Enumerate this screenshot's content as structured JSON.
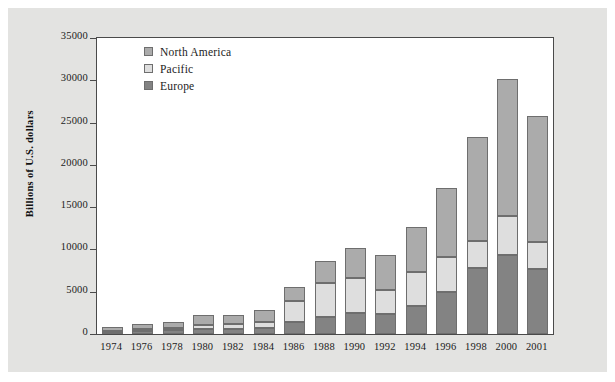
{
  "chart_data": {
    "type": "bar",
    "subtype": "stacked-vertical",
    "title": "",
    "xlabel": "",
    "ylabel": "Billions of U.S. dollars",
    "ylim": [
      0,
      35000
    ],
    "yticks": [
      0,
      5000,
      10000,
      15000,
      20000,
      25000,
      30000,
      35000
    ],
    "ytick_labels": [
      "0",
      "5000",
      "10000",
      "15000",
      "20000",
      "25000",
      "30000",
      "35000"
    ],
    "grid": false,
    "legend_position": "upper-left-inside",
    "stack_order_bottom_to_top": [
      "Europe",
      "Pacific",
      "North America"
    ],
    "categories": [
      "1974",
      "1976",
      "1978",
      "1980",
      "1982",
      "1984",
      "1986",
      "1988",
      "1990",
      "1992",
      "1994",
      "1996",
      "1998",
      "2000",
      "2001"
    ],
    "series": [
      {
        "name": "Europe",
        "color": "#838383",
        "values": [
          230,
          350,
          430,
          600,
          620,
          700,
          1400,
          2050,
          2450,
          2400,
          3350,
          5000,
          7750,
          9400,
          7700
        ]
      },
      {
        "name": "Pacific",
        "color": "#dedede",
        "values": [
          150,
          250,
          330,
          500,
          550,
          700,
          2500,
          4000,
          4200,
          2800,
          3950,
          4100,
          3250,
          4600,
          3150
        ]
      },
      {
        "name": "North America",
        "color": "#ababab",
        "values": [
          430,
          600,
          690,
          1150,
          1130,
          1450,
          1700,
          2600,
          3500,
          4200,
          5300,
          8200,
          12250,
          16200,
          14900
        ]
      }
    ],
    "totals": [
      810,
      1200,
      1450,
      2250,
      2300,
      2850,
      5600,
      8650,
      10150,
      9400,
      12600,
      17300,
      23250,
      30200,
      25750
    ]
  },
  "legend": {
    "items": [
      {
        "label": "North America",
        "swatch": "na"
      },
      {
        "label": "Pacific",
        "swatch": "pacific"
      },
      {
        "label": "Europe",
        "swatch": "europe"
      }
    ]
  },
  "axes": {
    "y_title": "Billions of U.S. dollars"
  }
}
